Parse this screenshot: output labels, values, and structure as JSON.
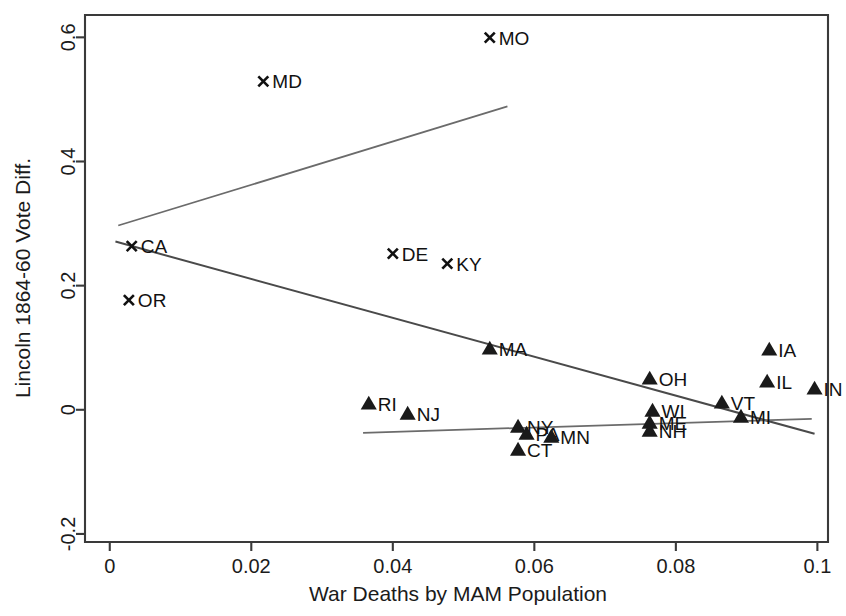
{
  "chart_data": {
    "type": "scatter",
    "title": "",
    "xlabel": "War Deaths by MAM Population",
    "ylabel": "Lincoln 1864-60 Vote Diff.",
    "xlim": [
      -0.0035,
      0.1015
    ],
    "ylim": [
      -0.213,
      0.636
    ],
    "xticks": [
      0,
      0.02,
      0.04,
      0.06,
      0.08,
      0.1
    ],
    "xticklabels": [
      "0",
      "0.02",
      "0.04",
      "0.06",
      "0.08",
      "0.1"
    ],
    "yticks": [
      -0.2,
      0,
      0.2,
      0.4,
      0.6
    ],
    "yticklabels": [
      "-0.2",
      "0",
      "0.2",
      "0.4",
      "0.6"
    ],
    "grid": false,
    "legend": null,
    "series": [
      {
        "name": "Border / Pacific states",
        "marker": "x",
        "points": [
          {
            "label": "MO",
            "x": 0.0537,
            "y": 0.5996,
            "label_side": "right"
          },
          {
            "label": "MD",
            "x": 0.0217,
            "y": 0.529,
            "label_side": "right"
          },
          {
            "label": "KY",
            "x": 0.0477,
            "y": 0.2355,
            "label_side": "right"
          },
          {
            "label": "DE",
            "x": 0.04,
            "y": 0.2517,
            "label_side": "right"
          },
          {
            "label": "CA",
            "x": 0.0031,
            "y": 0.2637,
            "label_side": "right"
          },
          {
            "label": "OR",
            "x": 0.0027,
            "y": 0.1766,
            "label_side": "right"
          }
        ]
      },
      {
        "name": "Union states",
        "marker": "triangle",
        "points": [
          {
            "label": "IA",
            "x": 0.0932,
            "y": 0.0968,
            "label_side": "right"
          },
          {
            "label": "IL",
            "x": 0.0929,
            "y": 0.0452,
            "label_side": "right"
          },
          {
            "label": "IN",
            "x": 0.0996,
            "y": 0.0339,
            "label_side": "right"
          },
          {
            "label": "OH",
            "x": 0.0763,
            "y": 0.05,
            "label_side": "right"
          },
          {
            "label": "MA",
            "x": 0.0537,
            "y": 0.0984,
            "label_side": "right"
          },
          {
            "label": "VT",
            "x": 0.0865,
            "y": 0.0113,
            "label_side": "right"
          },
          {
            "label": "MI",
            "x": 0.0892,
            "y": -0.0113,
            "label_side": "right"
          },
          {
            "label": "WI",
            "x": 0.0767,
            "y": -0.0016,
            "label_side": "right"
          },
          {
            "label": "ME",
            "x": 0.0763,
            "y": -0.021,
            "label_side": "right"
          },
          {
            "label": "NH",
            "x": 0.0763,
            "y": -0.0339,
            "label_side": "right"
          },
          {
            "label": "RI",
            "x": 0.0366,
            "y": 0.0097,
            "label_side": "right"
          },
          {
            "label": "NJ",
            "x": 0.0421,
            "y": -0.0065,
            "label_side": "right"
          },
          {
            "label": "NY",
            "x": 0.0577,
            "y": -0.0274,
            "label_side": "right"
          },
          {
            "label": "PA",
            "x": 0.0589,
            "y": -0.0387,
            "label_side": "right"
          },
          {
            "label": "MN",
            "x": 0.0624,
            "y": -0.0435,
            "label_side": "right"
          },
          {
            "label": "CT",
            "x": 0.0577,
            "y": -0.0645,
            "label_side": "right"
          }
        ]
      }
    ],
    "fit_lines": [
      {
        "name": "border-states-fit",
        "style": "light",
        "x0": 0.0012,
        "y0": 0.2968,
        "x1": 0.0562,
        "y1": 0.4887
      },
      {
        "name": "all-states-fit",
        "style": "dark",
        "x0": 0.0008,
        "y0": 0.271,
        "x1": 0.0996,
        "y1": -0.0387
      },
      {
        "name": "union-states-fit",
        "style": "light",
        "x0": 0.0358,
        "y0": -0.0371,
        "x1": 0.0992,
        "y1": -0.0145
      }
    ],
    "colors": {
      "marker": "#1a1a1a",
      "axis": "#3a3a3a",
      "fit_light": "#6b6b6b",
      "fit_dark": "#4a4a4a",
      "background": "#ffffff"
    }
  }
}
